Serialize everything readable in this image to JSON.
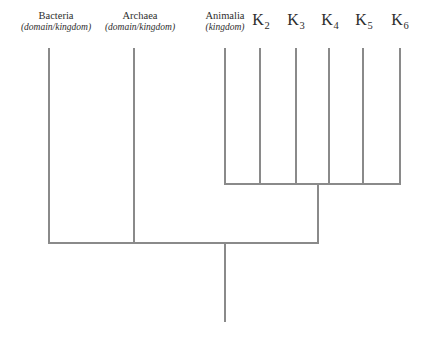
{
  "diagram": {
    "type": "cladogram",
    "background_color": "#ffffff",
    "line_color": "#8a8a8a",
    "text_color": "#2e2e2e",
    "taxa": [
      {
        "id": "bacteria",
        "name": "Bacteria",
        "rank": "(domain/kingdom)",
        "tip_x": 49,
        "label_center_x": 56,
        "label_top_y": 10,
        "branch_top_y": 48,
        "branch_bottom_y": 243
      },
      {
        "id": "archaea",
        "name": "Archaea",
        "rank": "(domain/kingdom)",
        "tip_x": 134,
        "label_center_x": 140,
        "label_top_y": 10,
        "branch_top_y": 48,
        "branch_bottom_y": 243
      },
      {
        "id": "animalia",
        "name": "Animalia",
        "rank": "(kingdom)",
        "tip_x": 225,
        "label_center_x": 225,
        "label_top_y": 10,
        "branch_top_y": 48,
        "branch_bottom_y": 184
      }
    ],
    "hypothetical_kingdoms": [
      {
        "id": "k2",
        "letter": "K",
        "subscript": "2",
        "tip_x": 260,
        "label_center_x": 261,
        "label_top_y": 12,
        "branch_top_y": 48,
        "branch_bottom_y": 184
      },
      {
        "id": "k3",
        "letter": "K",
        "subscript": "3",
        "tip_x": 296,
        "label_center_x": 296,
        "label_top_y": 12,
        "branch_top_y": 48,
        "branch_bottom_y": 184
      },
      {
        "id": "k4",
        "letter": "K",
        "subscript": "4",
        "tip_x": 329,
        "label_center_x": 330,
        "label_top_y": 12,
        "branch_top_y": 48,
        "branch_bottom_y": 184
      },
      {
        "id": "k5",
        "letter": "K",
        "subscript": "5",
        "tip_x": 363,
        "label_center_x": 364,
        "label_top_y": 12,
        "branch_top_y": 48,
        "branch_bottom_y": 184
      },
      {
        "id": "k6",
        "letter": "K",
        "subscript": "6",
        "tip_x": 400,
        "label_center_x": 400,
        "label_top_y": 12,
        "branch_top_y": 48,
        "branch_bottom_y": 184
      }
    ],
    "internal_nodes": [
      {
        "id": "eukaryote-clade-bar",
        "description": "horizontal bar joining Animalia with K2-K6",
        "y": 184,
        "x_start": 225,
        "x_end": 400
      },
      {
        "id": "eukaryote-clade-stem",
        "description": "vertical stem from clade bar down to root bar",
        "x": 318,
        "y_start": 184,
        "y_end": 243
      },
      {
        "id": "root-bar",
        "description": "horizontal bar joining Bacteria, Archaea and the eukaryote clade",
        "y": 243,
        "x_start": 49,
        "x_end": 318
      },
      {
        "id": "root-stem",
        "description": "vertical root stem descending from root bar",
        "x": 225,
        "y_start": 243,
        "y_end": 322
      }
    ]
  }
}
